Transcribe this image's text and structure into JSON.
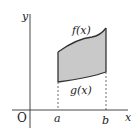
{
  "diagram": {
    "type": "area-between-curves",
    "axes": {
      "x_label": "x",
      "y_label": "y",
      "origin_label": "O"
    },
    "bounds": {
      "a_label": "a",
      "b_label": "b"
    },
    "curves": [
      {
        "name": "upper",
        "label": "f(x)"
      },
      {
        "name": "lower",
        "label": "g(x)"
      }
    ],
    "colors": {
      "fill": "#c9c9c9",
      "stroke": "#333333",
      "background": "#ffffff"
    }
  }
}
